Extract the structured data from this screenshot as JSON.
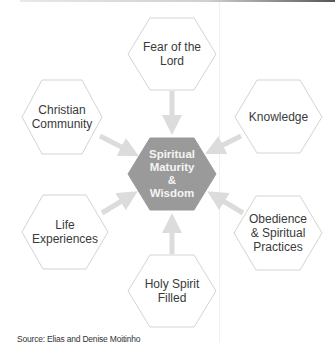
{
  "diagram": {
    "type": "hub-and-spoke",
    "center": {
      "label_lines": [
        "Spiritual",
        "Maturity",
        "&",
        "Wisdom"
      ],
      "fill": "#9a9a9a"
    },
    "nodes": [
      {
        "id": "fear",
        "label_lines": [
          "Fear of the",
          "Lord"
        ],
        "position": "top"
      },
      {
        "id": "knowledge",
        "label_lines": [
          "Knowledge"
        ],
        "position": "upper-right"
      },
      {
        "id": "obedience",
        "label_lines": [
          "Obedience",
          "& Spiritual",
          "Practices"
        ],
        "position": "lower-right"
      },
      {
        "id": "holy-spirit",
        "label_lines": [
          "Holy Spirit",
          "Filled"
        ],
        "position": "bottom"
      },
      {
        "id": "life",
        "label_lines": [
          "Life",
          "Experiences"
        ],
        "position": "lower-left"
      },
      {
        "id": "community",
        "label_lines": [
          "Christian",
          "Community"
        ],
        "position": "upper-left"
      }
    ],
    "edge_color": "#dcdcdc",
    "node_stroke": "#c8c8c8"
  },
  "labels": {
    "center": "Spiritual\nMaturity\n&\nWisdom",
    "fear": "Fear of the\nLord",
    "knowledge": "Knowledge",
    "obedience": "Obedience\n& Spiritual\nPractices",
    "holy_spirit": "Holy Spirit\nFilled",
    "life": "Life\nExperiences",
    "community": "Christian\nCommunity"
  },
  "source": "Source: Elias and Denise Moitinho"
}
